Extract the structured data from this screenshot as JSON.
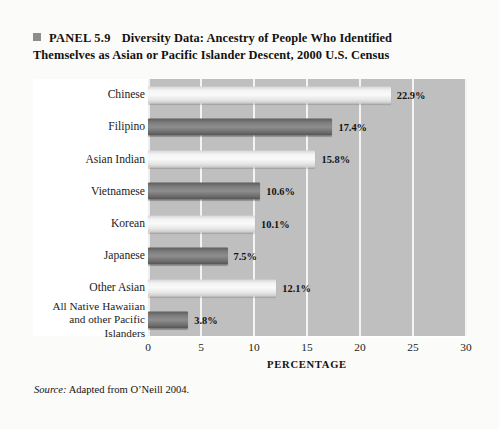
{
  "panel": {
    "bullet_icon": "square-bullet-icon",
    "tag": "PANEL 5.9",
    "title_line1": "Diversity Data: Ancestry of People Who Identified",
    "title_line2": "Themselves as Asian or Pacific Islander Descent, 2000 U.S. Census"
  },
  "source": {
    "label": "Source:",
    "text": "Adapted from O’Neill 2004."
  },
  "chart_data": {
    "type": "bar",
    "orientation": "horizontal",
    "title": "Diversity Data: Ancestry of People Who Identified Themselves as Asian or Pacific Islander Descent, 2000 U.S. Census",
    "xlabel": "PERCENTAGE",
    "ylabel": "",
    "xlim": [
      0,
      30
    ],
    "xticks": [
      0,
      5,
      10,
      15,
      20,
      25,
      30
    ],
    "grid": true,
    "legend": "none",
    "categories": [
      "Chinese",
      "Filipino",
      "Asian Indian",
      "Vietnamese",
      "Korean",
      "Japanese",
      "Other Asian",
      "All Native Hawaiian and other Pacific Islanders"
    ],
    "category_lines": [
      [
        "Chinese"
      ],
      [
        "Filipino"
      ],
      [
        "Asian Indian"
      ],
      [
        "Vietnamese"
      ],
      [
        "Korean"
      ],
      [
        "Japanese"
      ],
      [
        "Other Asian"
      ],
      [
        "All Native Hawaiian",
        "and other Pacific",
        "Islanders"
      ]
    ],
    "values": [
      22.9,
      17.4,
      15.8,
      10.6,
      10.1,
      7.5,
      12.1,
      3.8
    ],
    "value_labels": [
      "22.9%",
      "17.4%",
      "15.8%",
      "10.6%",
      "10.1%",
      "7.5%",
      "12.1%",
      "3.8%"
    ],
    "bar_shades": [
      "light",
      "dark",
      "light",
      "dark",
      "light",
      "dark",
      "light",
      "dark"
    ],
    "colors": {
      "bar_light": "#f3f3f3",
      "bar_dark": "#7d7d7d",
      "plot_background": "#bfbfbf",
      "gridline": "#f4f4f4",
      "text": "#1b1b1b",
      "page_background": "#fbfbfa"
    }
  }
}
